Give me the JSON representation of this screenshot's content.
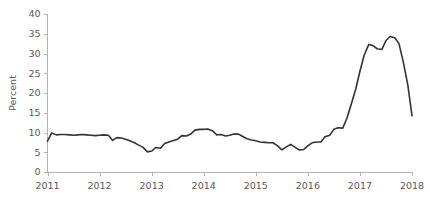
{
  "chart_data": {
    "type": "line",
    "title": "",
    "subtitle": "",
    "xlabel": "",
    "ylabel": "Percent",
    "xlim": [
      2011,
      2018
    ],
    "ylim": [
      0,
      40
    ],
    "grid": false,
    "legend": false,
    "legend_position": "none",
    "y_ticks": [
      0,
      5,
      10,
      15,
      20,
      25,
      30,
      35,
      40
    ],
    "x_ticks": [
      2011,
      2012,
      2013,
      2014,
      2015,
      2016,
      2017,
      2018
    ],
    "y_tick_labels": [
      "0",
      "5",
      "10",
      "15",
      "20",
      "25",
      "30",
      "35",
      "40"
    ],
    "x_tick_labels": [
      "2011",
      "2012",
      "2013",
      "2014",
      "2015",
      "2016",
      "2017",
      "2018"
    ],
    "series": [
      {
        "name": "Percent",
        "color": "#333333",
        "x": [
          2011.0,
          2011.08,
          2011.17,
          2011.25,
          2011.33,
          2011.42,
          2011.5,
          2011.58,
          2011.67,
          2011.75,
          2011.83,
          2011.92,
          2012.0,
          2012.08,
          2012.17,
          2012.25,
          2012.33,
          2012.42,
          2012.5,
          2012.58,
          2012.67,
          2012.75,
          2012.83,
          2012.92,
          2013.0,
          2013.08,
          2013.17,
          2013.25,
          2013.33,
          2013.42,
          2013.5,
          2013.58,
          2013.67,
          2013.75,
          2013.83,
          2013.92,
          2014.0,
          2014.08,
          2014.17,
          2014.25,
          2014.33,
          2014.42,
          2014.5,
          2014.58,
          2014.67,
          2014.75,
          2014.83,
          2014.92,
          2015.0,
          2015.08,
          2015.17,
          2015.25,
          2015.33,
          2015.42,
          2015.5,
          2015.58,
          2015.67,
          2015.75,
          2015.83,
          2015.92,
          2016.0,
          2016.08,
          2016.17,
          2016.25,
          2016.33,
          2016.42,
          2016.5,
          2016.58,
          2016.67,
          2016.75,
          2016.83,
          2016.92,
          2017.0,
          2017.08,
          2017.17,
          2017.25,
          2017.33,
          2017.42,
          2017.5,
          2017.58,
          2017.67,
          2017.75,
          2017.83,
          2017.92,
          2018.0
        ],
        "y": [
          7.8,
          9.9,
          9.4,
          9.5,
          9.5,
          9.4,
          9.3,
          9.4,
          9.5,
          9.4,
          9.3,
          9.2,
          9.3,
          9.4,
          9.3,
          8.0,
          8.7,
          8.6,
          8.3,
          7.9,
          7.4,
          6.8,
          6.3,
          5.1,
          5.3,
          6.2,
          6.0,
          7.2,
          7.6,
          8.0,
          8.3,
          9.2,
          9.1,
          9.6,
          10.6,
          10.8,
          10.8,
          10.9,
          10.4,
          9.4,
          9.5,
          9.1,
          9.3,
          9.6,
          9.6,
          9.0,
          8.4,
          8.1,
          7.9,
          7.6,
          7.5,
          7.4,
          7.4,
          6.6,
          5.6,
          6.3,
          7.0,
          6.3,
          5.6,
          5.7,
          6.6,
          7.4,
          7.6,
          7.6,
          8.9,
          9.3,
          10.8,
          11.2,
          11.1,
          13.6,
          17.0,
          21.0,
          25.5,
          29.5,
          32.3,
          32.0,
          31.2,
          31.0,
          33.3,
          34.3,
          34.0,
          32.5,
          28.0,
          22.0,
          14.2
        ]
      }
    ]
  },
  "axis": {
    "y_title": "Percent"
  }
}
